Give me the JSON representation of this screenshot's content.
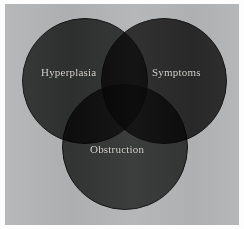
{
  "figure": {
    "type": "venn-diagram",
    "set_count": 3,
    "background_color": "#b3b4b5",
    "paper_color": "#fdfdfd",
    "label_color": "#d8d6d2"
  },
  "chart_data": {
    "type": "venn",
    "title": "",
    "subtitle": "",
    "xlabel": "",
    "ylabel": "",
    "legend_position": "none",
    "grid": false,
    "sets": [
      {
        "id": "hyperplasia",
        "label": "Hyperplasia",
        "color": "#434343",
        "position": "top-left",
        "center": [
          80,
          77
        ],
        "radius": 63
      },
      {
        "id": "symptoms",
        "label": "Symptoms",
        "color": "#3a3a3a",
        "position": "top-right",
        "center": [
          159,
          77
        ],
        "radius": 63
      },
      {
        "id": "obstruction",
        "label": "Obstruction",
        "color": "#4a4a4a",
        "position": "bottom-center",
        "center": [
          120,
          143
        ],
        "radius": 63
      }
    ],
    "intersections": [
      {
        "sets": [
          "hyperplasia",
          "symptoms"
        ],
        "label": ""
      },
      {
        "sets": [
          "hyperplasia",
          "obstruction"
        ],
        "label": ""
      },
      {
        "sets": [
          "symptoms",
          "obstruction"
        ],
        "label": ""
      },
      {
        "sets": [
          "hyperplasia",
          "symptoms",
          "obstruction"
        ],
        "label": ""
      }
    ]
  }
}
